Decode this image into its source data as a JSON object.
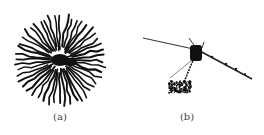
{
  "figure": {
    "panels": [
      {
        "id": "a",
        "label": "(a)",
        "description": "radial dendritic pattern"
      },
      {
        "id": "b",
        "label": "(b)",
        "description": "linear streak with central blob and cluster"
      }
    ]
  }
}
